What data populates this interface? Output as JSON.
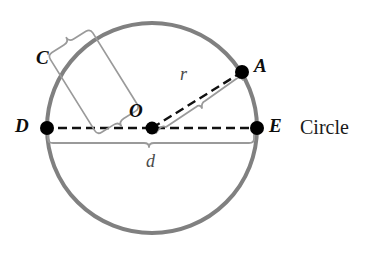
{
  "figure": {
    "kind": "geometry-diagram",
    "subject": "Circle",
    "caption": "Circle",
    "width": 369,
    "height": 264,
    "background_color": "#ffffff"
  },
  "colors": {
    "circle_stroke": "#808080",
    "dash_line": "#111111",
    "point_fill": "#000000",
    "brace_stroke": "#9a9a9a",
    "label_text": "#0d0d0d",
    "measure_text": "#4a4a4a",
    "caption_text": "#1a1a1a"
  },
  "circle": {
    "center_x": 152,
    "center_y": 128,
    "radius": 105,
    "stroke_width": 4
  },
  "points": [
    {
      "id": "O",
      "label": "O",
      "x": 152,
      "y": 128,
      "dot_r": 6,
      "label_x": 129,
      "label_y": 101,
      "role": "center"
    },
    {
      "id": "A",
      "label": "A",
      "x": 242,
      "y": 72,
      "dot_r": 7,
      "label_x": 254,
      "label_y": 56,
      "role": "on-circumference"
    },
    {
      "id": "D",
      "label": "D",
      "x": 47,
      "y": 128,
      "dot_r": 7,
      "label_x": 15,
      "label_y": 116,
      "role": "diameter-endpoint"
    },
    {
      "id": "E",
      "label": "E",
      "x": 257,
      "y": 128,
      "dot_r": 7,
      "label_x": 269,
      "label_y": 116,
      "role": "diameter-endpoint"
    }
  ],
  "arc_label": {
    "text": "C",
    "x": 36,
    "y": 48,
    "meaning": "circumference"
  },
  "segments": [
    {
      "id": "diameter",
      "from": "D",
      "to": "E",
      "style": "dashed",
      "measure": "d"
    },
    {
      "id": "radius",
      "from": "O",
      "to": "A",
      "style": "dashed",
      "measure": "r"
    }
  ],
  "measures": [
    {
      "id": "radius-measure",
      "symbol": "r",
      "label_x": 180,
      "label_y": 65,
      "describes": "radius",
      "brace_side": "above"
    },
    {
      "id": "diameter-measure",
      "symbol": "d",
      "label_x": 146,
      "label_y": 152,
      "describes": "diameter",
      "brace_side": "below"
    }
  ],
  "caption": {
    "text": "Circle",
    "x": 300,
    "y": 117
  }
}
